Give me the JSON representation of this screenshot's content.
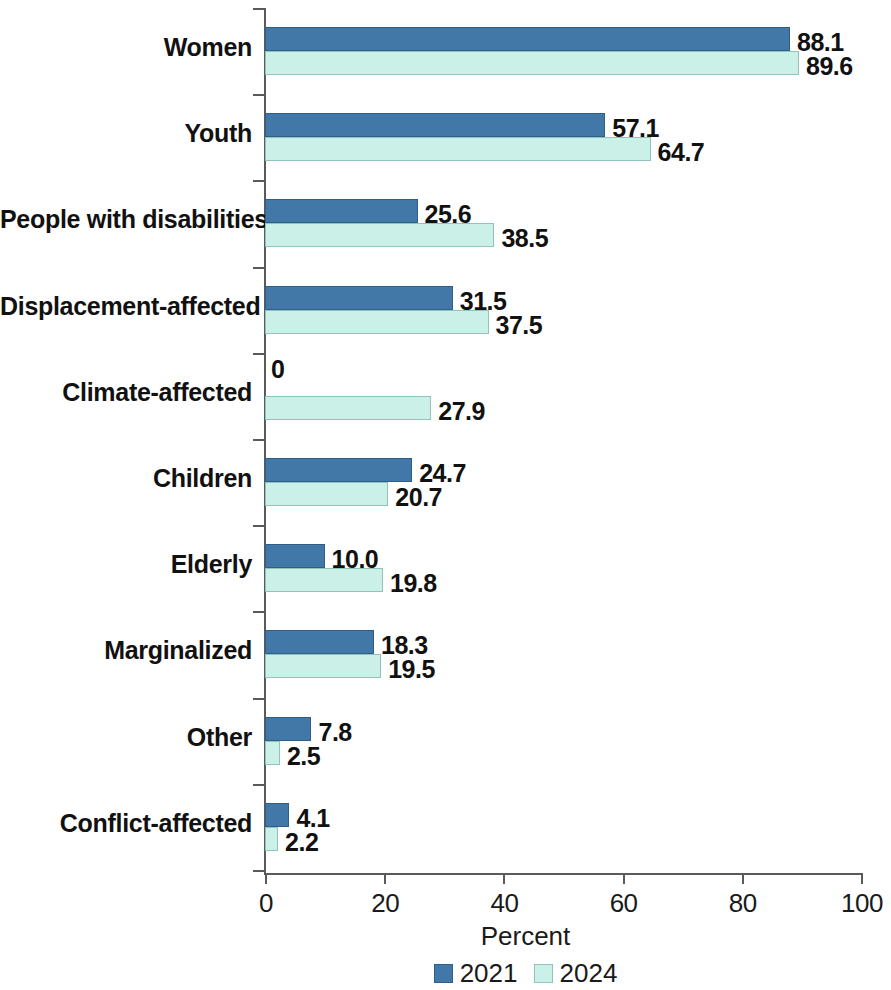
{
  "chart_data": {
    "type": "bar",
    "orientation": "horizontal",
    "title": "",
    "xlabel": "Percent",
    "ylabel": "",
    "xlim": [
      0,
      100
    ],
    "xticks": [
      0,
      20,
      40,
      60,
      80,
      100
    ],
    "grid": false,
    "legend_position": "bottom",
    "categories": [
      "Women",
      "Youth",
      "People with disabilities",
      "Displacement-affected",
      "Climate-affected",
      "Children",
      "Elderly",
      "Marginalized",
      "Other",
      "Conflict-affected"
    ],
    "series": [
      {
        "name": "2021",
        "color": "#4178a8",
        "values": [
          88.1,
          57.1,
          25.6,
          31.5,
          0,
          24.7,
          10.0,
          18.3,
          7.8,
          4.1
        ],
        "labels": [
          "88.1",
          "57.1",
          "25.6",
          "31.5",
          "0",
          "24.7",
          "10.0",
          "18.3",
          "7.8",
          "4.1"
        ]
      },
      {
        "name": "2024",
        "color": "#cbf0e8",
        "values": [
          89.6,
          64.7,
          38.5,
          37.5,
          27.9,
          20.7,
          19.8,
          19.5,
          2.5,
          2.2
        ],
        "labels": [
          "89.6",
          "64.7",
          "38.5",
          "37.5",
          "27.9",
          "20.7",
          "19.8",
          "19.5",
          "2.5",
          "2.2"
        ]
      }
    ]
  },
  "axis": {
    "x_title": "Percent",
    "tick_labels": [
      "0",
      "20",
      "40",
      "60",
      "80",
      "100"
    ]
  },
  "legend": {
    "items": [
      {
        "label": "2021",
        "color": "#4178a8"
      },
      {
        "label": "2024",
        "color": "#cbf0e8"
      }
    ]
  }
}
